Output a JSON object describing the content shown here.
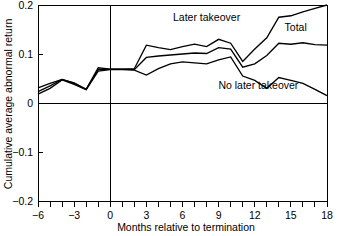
{
  "chart_data": {
    "type": "line",
    "title": "",
    "subtitle": "",
    "xlabel": "Months relative to termination",
    "ylabel": "Cumulative average abnormal return",
    "xlim": [
      -6,
      18
    ],
    "ylim": [
      -0.2,
      0.2
    ],
    "grid": false,
    "legend_position": "inline-annotations",
    "x_tick_labels": [
      "-6",
      "-3",
      "0",
      "3",
      "6",
      "9",
      "12",
      "15",
      "18"
    ],
    "x_tick_values": [
      -6,
      -3,
      0,
      3,
      6,
      9,
      12,
      15,
      18
    ],
    "x_minor_tick_values": [
      -6,
      -5,
      -4,
      -3,
      -2,
      -1,
      0,
      1,
      2,
      3,
      4,
      5,
      6,
      7,
      8,
      9,
      10,
      11,
      12,
      13,
      14,
      15,
      16,
      17,
      18
    ],
    "y_tick_labels": [
      "0.2",
      "0.1",
      "0",
      "-0.1",
      "-0.2"
    ],
    "y_tick_values": [
      0.2,
      0.1,
      0,
      -0.1,
      -0.2
    ],
    "reference_lines": [
      {
        "axis": "x",
        "value": 0
      },
      {
        "axis": "y",
        "value": 0
      }
    ],
    "x": [
      -6,
      -5,
      -4,
      -3,
      -2,
      -1,
      0,
      1,
      2,
      3,
      4,
      5,
      6,
      7,
      8,
      9,
      10,
      11,
      12,
      13,
      14,
      15,
      16,
      17,
      18
    ],
    "series": [
      {
        "name": "Later takeover",
        "label": "Later takeover",
        "values": [
          0.031,
          0.04,
          0.048,
          0.041,
          0.028,
          0.072,
          0.069,
          0.069,
          0.07,
          0.118,
          0.113,
          0.109,
          0.115,
          0.12,
          0.115,
          0.13,
          0.122,
          0.085,
          0.11,
          0.133,
          0.175,
          0.178,
          0.186,
          0.193,
          0.2
        ]
      },
      {
        "name": "Total",
        "label": "Total",
        "values": [
          0.023,
          0.035,
          0.048,
          0.04,
          0.028,
          0.068,
          0.069,
          0.069,
          0.068,
          0.093,
          0.096,
          0.098,
          0.1,
          0.102,
          0.101,
          0.113,
          0.11,
          0.073,
          0.08,
          0.097,
          0.122,
          0.12,
          0.123,
          0.119,
          0.118
        ]
      },
      {
        "name": "No later takeover",
        "label": "No later takeover",
        "values": [
          0.018,
          0.03,
          0.047,
          0.038,
          0.027,
          0.065,
          0.068,
          0.068,
          0.067,
          0.057,
          0.07,
          0.08,
          0.084,
          0.082,
          0.08,
          0.088,
          0.094,
          0.055,
          0.046,
          0.03,
          0.052,
          0.046,
          0.04,
          0.028,
          0.015
        ]
      }
    ],
    "annotations": [
      {
        "text": "Later takeover",
        "x": 8.0,
        "y": 0.168
      },
      {
        "text": "Total",
        "x": 15.4,
        "y": 0.146
      },
      {
        "text": "No later takeover",
        "x": 12.3,
        "y": 0.028
      }
    ]
  }
}
